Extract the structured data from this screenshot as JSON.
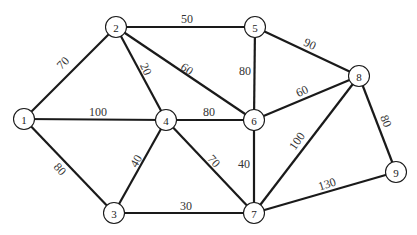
{
  "graph": {
    "type": "weighted-undirected-graph",
    "nodes": [
      {
        "id": "1",
        "x": 24,
        "y": 119
      },
      {
        "id": "2",
        "x": 116,
        "y": 27
      },
      {
        "id": "3",
        "x": 114,
        "y": 213
      },
      {
        "id": "4",
        "x": 166,
        "y": 120
      },
      {
        "id": "5",
        "x": 255,
        "y": 27
      },
      {
        "id": "6",
        "x": 254,
        "y": 120
      },
      {
        "id": "7",
        "x": 254,
        "y": 213
      },
      {
        "id": "8",
        "x": 359,
        "y": 76
      },
      {
        "id": "9",
        "x": 396,
        "y": 172
      }
    ],
    "edges": [
      {
        "from": "1",
        "to": "2",
        "weight": "70",
        "lx": 63,
        "ly": 63,
        "rot": -45
      },
      {
        "from": "1",
        "to": "4",
        "weight": "100",
        "lx": 98,
        "ly": 112,
        "rot": 0
      },
      {
        "from": "1",
        "to": "3",
        "weight": "80",
        "lx": 60,
        "ly": 169,
        "rot": 48
      },
      {
        "from": "2",
        "to": "5",
        "weight": "50",
        "lx": 187,
        "ly": 19,
        "rot": 0
      },
      {
        "from": "2",
        "to": "4",
        "weight": "20",
        "lx": 146,
        "ly": 69,
        "rot": 65
      },
      {
        "from": "2",
        "to": "6",
        "weight": "60",
        "lx": 187,
        "ly": 69,
        "rot": 35
      },
      {
        "from": "4",
        "to": "6",
        "weight": "80",
        "lx": 209,
        "ly": 112,
        "rot": 0
      },
      {
        "from": "4",
        "to": "3",
        "weight": "40",
        "lx": 136,
        "ly": 161,
        "rot": -60
      },
      {
        "from": "4",
        "to": "7",
        "weight": "70",
        "lx": 214,
        "ly": 161,
        "rot": 48
      },
      {
        "from": "3",
        "to": "7",
        "weight": "30",
        "lx": 186,
        "ly": 206,
        "rot": 0
      },
      {
        "from": "5",
        "to": "6",
        "weight": "80",
        "lx": 245,
        "ly": 71,
        "rot": 0
      },
      {
        "from": "5",
        "to": "8",
        "weight": "90",
        "lx": 310,
        "ly": 44,
        "rot": 25
      },
      {
        "from": "6",
        "to": "8",
        "weight": "60",
        "lx": 302,
        "ly": 91,
        "rot": -25
      },
      {
        "from": "6",
        "to": "7",
        "weight": "40",
        "lx": 244,
        "ly": 164,
        "rot": 0
      },
      {
        "from": "7",
        "to": "8",
        "weight": "100",
        "lx": 297,
        "ly": 141,
        "rot": -55
      },
      {
        "from": "7",
        "to": "9",
        "weight": "130",
        "lx": 327,
        "ly": 184,
        "rot": -18
      },
      {
        "from": "8",
        "to": "9",
        "weight": "80",
        "lx": 386,
        "ly": 121,
        "rot": 68
      }
    ]
  },
  "colors": {
    "stroke": "#1a1a1a",
    "background": "#ffffff",
    "text": "#333333"
  }
}
